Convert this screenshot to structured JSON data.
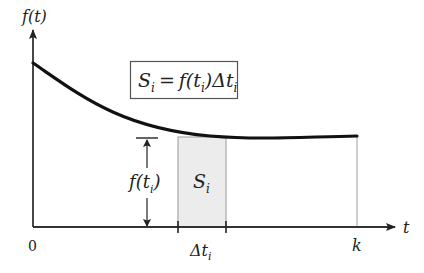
{
  "diagram": {
    "type": "area-under-curve",
    "axes": {
      "y_label": "f(t)",
      "x_label": "t",
      "origin_label": "0",
      "x_end_label": "k"
    },
    "formula": {
      "lhs": "S",
      "lhs_sub": "i",
      "eq": "=",
      "f": "f(t",
      "f_sub": "i",
      "f_close": ")",
      "delta": "Δt",
      "delta_sub": "i"
    },
    "strip": {
      "label": "S",
      "label_sub": "i",
      "width_label": "Δt",
      "width_label_sub": "i",
      "height_label": "f(t",
      "height_label_sub": "i",
      "height_label_close": ")",
      "fill_color": "#ececec",
      "edge_color": "#999999"
    },
    "colors": {
      "curve": "#111111",
      "axes": "#333333",
      "box_border": "#555555"
    }
  }
}
